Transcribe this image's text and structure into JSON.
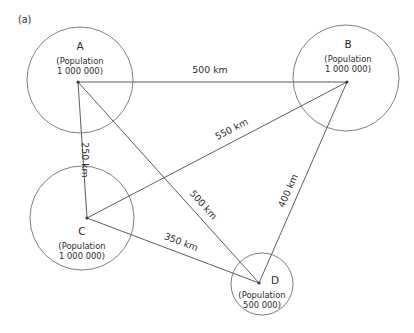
{
  "figure": {
    "panel_label": "(a)",
    "units": "km"
  },
  "nodes": [
    {
      "id": "A",
      "letter": "A",
      "pop_line1": "(Population",
      "pop_line2": "1 000 000)",
      "population": 1000000,
      "cx": 80,
      "cy": 80,
      "r": 53,
      "vx": 78,
      "vy": 82,
      "letter_x": 80,
      "letter_y": 50,
      "pop_x": 80,
      "pop_y": 64
    },
    {
      "id": "B",
      "letter": "B",
      "pop_line1": "(Population",
      "pop_line2": "1 000 000)",
      "population": 1000000,
      "cx": 346,
      "cy": 78,
      "r": 53,
      "vx": 347,
      "vy": 82,
      "letter_x": 348,
      "letter_y": 48,
      "pop_x": 348,
      "pop_y": 62
    },
    {
      "id": "C",
      "letter": "C",
      "pop_line1": "(Population",
      "pop_line2": "1 000 000)",
      "population": 1000000,
      "cx": 82,
      "cy": 218,
      "r": 52,
      "vx": 87,
      "vy": 218,
      "letter_x": 82,
      "letter_y": 235,
      "pop_x": 82,
      "pop_y": 249
    },
    {
      "id": "D",
      "letter": "D",
      "pop_line1": "(Population",
      "pop_line2": "500 000)",
      "population": 500000,
      "cx": 262,
      "cy": 284,
      "r": 31,
      "vx": 259,
      "vy": 283,
      "letter_x": 275,
      "letter_y": 284,
      "pop_x": 262,
      "pop_y": 298
    }
  ],
  "edges": [
    {
      "id": "A-B",
      "from": "A",
      "to": "B",
      "label": "500 km",
      "distance_km": 500,
      "x1": 78,
      "y1": 82,
      "x2": 347,
      "y2": 82,
      "label_x": 210,
      "label_y": 73,
      "label_rotate": 0
    },
    {
      "id": "A-C",
      "from": "A",
      "to": "C",
      "label": "250 km",
      "distance_km": 250,
      "x1": 78,
      "y1": 82,
      "x2": 87,
      "y2": 218,
      "label_x": 82,
      "label_y": 160,
      "label_rotate": 90
    },
    {
      "id": "C-B",
      "from": "C",
      "to": "B",
      "label": "550 km",
      "distance_km": 550,
      "x1": 87,
      "y1": 218,
      "x2": 347,
      "y2": 82,
      "label_x": 233,
      "label_y": 132,
      "label_rotate": -27
    },
    {
      "id": "A-D",
      "from": "A",
      "to": "D",
      "label": "500 km",
      "distance_km": 500,
      "x1": 78,
      "y1": 82,
      "x2": 259,
      "y2": 283,
      "label_x": 201,
      "label_y": 207,
      "label_rotate": 48
    },
    {
      "id": "C-D",
      "from": "C",
      "to": "D",
      "label": "350 km",
      "distance_km": 350,
      "x1": 87,
      "y1": 218,
      "x2": 259,
      "y2": 283,
      "label_x": 180,
      "label_y": 245,
      "label_rotate": 21
    },
    {
      "id": "D-B",
      "from": "D",
      "to": "B",
      "label": "400 km",
      "distance_km": 400,
      "x1": 259,
      "y1": 283,
      "x2": 347,
      "y2": 82,
      "label_x": 291,
      "label_y": 192,
      "label_rotate": -66
    }
  ],
  "colors": {
    "circle_stroke": "#6f6f6f",
    "edge_stroke": "#4a4a4a",
    "text": "#2b2b2b",
    "background": "#ffffff"
  }
}
